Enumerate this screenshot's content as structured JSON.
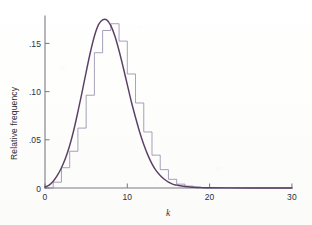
{
  "figure": {
    "background_color": "#fdfdfc",
    "axis_color": "#7a7a86",
    "curve_color": "#5a3f66",
    "histogram_color": "#8f86a8"
  },
  "chart_data": {
    "type": "bar",
    "title": "",
    "subtitle": "",
    "xlabel": "k",
    "ylabel": "Relative frequency",
    "xlim": [
      0,
      30
    ],
    "ylim": [
      0,
      0.178
    ],
    "grid": false,
    "legend": null,
    "xticks": [
      0,
      10,
      20,
      30
    ],
    "xtick_labels": [
      "0",
      "10",
      "20",
      "30"
    ],
    "yticks": [
      0,
      0.05,
      0.1,
      0.15
    ],
    "ytick_labels": [
      "0",
      ".05",
      ".10",
      ".15"
    ],
    "bin_width": 1,
    "categories": [
      0,
      1,
      2,
      3,
      4,
      5,
      6,
      7,
      8,
      9,
      10,
      11,
      12,
      13,
      14,
      15,
      16,
      17,
      18,
      19,
      20,
      21,
      22,
      23,
      24,
      25,
      26,
      27,
      28,
      29
    ],
    "values": [
      0.0,
      0.006,
      0.021,
      0.038,
      0.062,
      0.096,
      0.14,
      0.163,
      0.17,
      0.152,
      0.118,
      0.088,
      0.058,
      0.034,
      0.019,
      0.009,
      0.004,
      0.002,
      0.001,
      0.0,
      0.0,
      0.0,
      0.0,
      0.0,
      0.0,
      0.0,
      0.0,
      0.0,
      0.0,
      0.0
    ],
    "series": [
      {
        "name": "Relative frequency histogram",
        "type": "bar",
        "values": [
          0.0,
          0.006,
          0.021,
          0.038,
          0.062,
          0.096,
          0.14,
          0.163,
          0.17,
          0.152,
          0.118,
          0.088,
          0.058,
          0.034,
          0.019,
          0.009,
          0.004,
          0.002,
          0.001,
          0.0,
          0.0,
          0.0,
          0.0,
          0.0,
          0.0,
          0.0,
          0.0,
          0.0,
          0.0,
          0.0
        ]
      },
      {
        "name": "Fitted smooth curve",
        "type": "line",
        "x": [
          0.0,
          0.5,
          1.0,
          1.5,
          2.0,
          2.5,
          3.0,
          3.5,
          4.0,
          4.5,
          5.0,
          5.5,
          6.0,
          6.5,
          7.0,
          7.5,
          8.0,
          8.5,
          9.0,
          9.5,
          10.0,
          10.5,
          11.0,
          11.5,
          12.0,
          12.5,
          13.0,
          13.5,
          14.0,
          14.5,
          15.0,
          15.5,
          16.0,
          17.0,
          18.0,
          19.0,
          20.0,
          22.0,
          25.0,
          30.0
        ],
        "y": [
          0.001,
          0.003,
          0.007,
          0.013,
          0.021,
          0.031,
          0.044,
          0.06,
          0.079,
          0.099,
          0.12,
          0.14,
          0.157,
          0.169,
          0.174,
          0.174,
          0.168,
          0.157,
          0.142,
          0.125,
          0.107,
          0.089,
          0.073,
          0.058,
          0.045,
          0.034,
          0.025,
          0.018,
          0.013,
          0.009,
          0.006,
          0.004,
          0.003,
          0.0015,
          0.0008,
          0.0004,
          0.0002,
          0.0001,
          0.0,
          0.0
        ]
      }
    ]
  }
}
